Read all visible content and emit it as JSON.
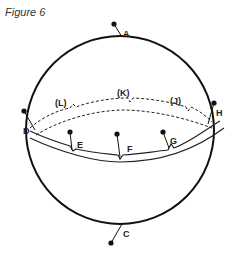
{
  "figure": {
    "title": "Figure 6"
  },
  "colors": {
    "stroke": "#111111",
    "text": "#222222",
    "background": "#ffffff"
  },
  "diagram": {
    "shape": "sphere",
    "labels": {
      "A": "A",
      "C": "C",
      "D": "D",
      "E": "E",
      "F": "F",
      "G": "G",
      "H": "H",
      "J": "(J)",
      "K": "(K)",
      "L": "(L)"
    }
  }
}
